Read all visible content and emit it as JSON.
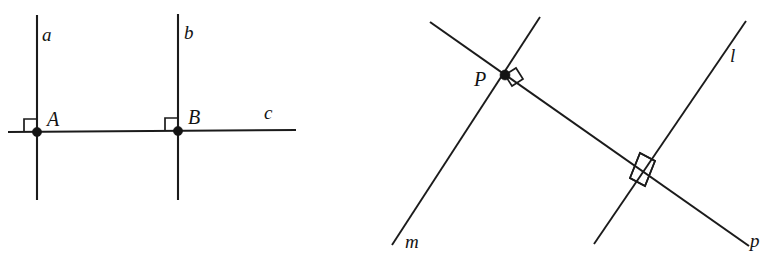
{
  "figure": {
    "canvas": {
      "width": 775,
      "height": 271,
      "background": "#ffffff"
    },
    "stroke_color": "#1b1b1b",
    "dot_color": "#141414"
  },
  "left_diagram": {
    "name": "two-perpendiculars-to-a-transversal",
    "labels": {
      "line_a": "a",
      "line_b": "b",
      "line_c": "c",
      "point_a": "A",
      "point_b": "B"
    },
    "label_positions": {
      "line_a": {
        "x": 42,
        "y": 41
      },
      "line_b": {
        "x": 184,
        "y": 39
      },
      "line_c": {
        "x": 264,
        "y": 119
      },
      "point_a": {
        "x": 47,
        "y": 126
      },
      "point_b": {
        "x": 188,
        "y": 124
      }
    },
    "lines": [
      {
        "id": "a",
        "x1": 37,
        "y1": 15,
        "x2": 37,
        "y2": 200
      },
      {
        "id": "b",
        "x1": 178,
        "y1": 14,
        "x2": 178,
        "y2": 200
      },
      {
        "id": "c",
        "x1": 8,
        "y1": 132,
        "x2": 296,
        "y2": 130
      }
    ],
    "points": [
      {
        "id": "A",
        "x": 37,
        "y": 132,
        "radius": 4.6
      },
      {
        "id": "B",
        "x": 178,
        "y": 131,
        "radius": 4.6
      }
    ],
    "right_angle_marks": [
      {
        "at": "A",
        "corner_x": 37,
        "corner_y": 132,
        "size": 13,
        "dir_x": -1,
        "dir_y": -1
      },
      {
        "at": "B",
        "corner_x": 178,
        "corner_y": 131,
        "size": 13,
        "dir_x": -1,
        "dir_y": -1
      }
    ]
  },
  "right_diagram": {
    "name": "two-lines-perpendicular-to-line-p",
    "labels": {
      "line_l": "l",
      "line_m": "m",
      "line_p": "p",
      "point_p": "P"
    },
    "label_positions": {
      "line_l": {
        "x": 730,
        "y": 62
      },
      "line_m": {
        "x": 405,
        "y": 248
      },
      "line_p": {
        "x": 750,
        "y": 247
      },
      "point_p": {
        "x": 474,
        "y": 86
      }
    },
    "lines": [
      {
        "id": "p",
        "x1": 430,
        "y1": 22,
        "x2": 749,
        "y2": 246
      },
      {
        "id": "m",
        "x1": 392,
        "y1": 245,
        "x2": 540,
        "y2": 17
      },
      {
        "id": "l",
        "x1": 594,
        "y1": 244,
        "x2": 746,
        "y2": 21
      }
    ],
    "points": [
      {
        "id": "P",
        "x": 505,
        "y": 75,
        "radius": 5.0
      }
    ],
    "intersections": [
      {
        "id": "P",
        "x": 505,
        "y": 75,
        "lines": [
          "p",
          "m"
        ]
      },
      {
        "id": "Q",
        "x": 641,
        "y": 170,
        "lines": [
          "p",
          "l"
        ]
      }
    ],
    "right_angle_marks": [
      {
        "at": "P",
        "x": 505,
        "y": 75,
        "size": 13,
        "rotation_deg": 35
      },
      {
        "at": "Q",
        "x": 641,
        "y": 170,
        "size": 17,
        "rotation_deg": 35
      }
    ]
  }
}
